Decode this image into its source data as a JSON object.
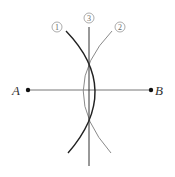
{
  "diagram": {
    "points": [
      {
        "label": "A",
        "x": 28,
        "y": 90
      },
      {
        "label": "B",
        "x": 151,
        "y": 90
      }
    ],
    "step_labels": [
      {
        "label": "1",
        "x": 57,
        "y": 27
      },
      {
        "label": "3",
        "x": 89,
        "y": 18
      },
      {
        "label": "2",
        "x": 120,
        "y": 27
      }
    ],
    "colors": {
      "arc1": "#222222",
      "arc2": "#8a8a8a",
      "segment": "#555555",
      "bisector": "#333333"
    }
  }
}
